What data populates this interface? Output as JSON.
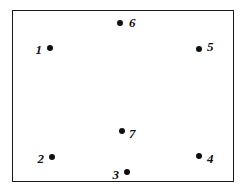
{
  "figure": {
    "background_color": "#ffffff",
    "border_color": "#1a1a1a",
    "marker_color": "#101010",
    "label_color": "#101010",
    "frame": {
      "x": 12,
      "y": 10,
      "width": 222,
      "height": 172
    }
  },
  "chart_data": {
    "type": "scatter",
    "title": "",
    "xlabel": "",
    "ylabel": "",
    "grid": false,
    "legend": "none",
    "axis_ticks": false,
    "xlim": [
      12,
      234
    ],
    "ylim": [
      10,
      182
    ],
    "marker_style": "filled-circle",
    "marker_size_px": 6,
    "label_style": "italic-serif-numeral",
    "points": [
      {
        "label": "1",
        "x": 50,
        "y": 48,
        "label_side": "left",
        "label_x": 42,
        "label_y": 49
      },
      {
        "label": "2",
        "x": 52,
        "y": 157,
        "label_side": "left",
        "label_x": 44,
        "label_y": 158
      },
      {
        "label": "3",
        "x": 127,
        "y": 172,
        "label_side": "left",
        "label_x": 119,
        "label_y": 174
      },
      {
        "label": "4",
        "x": 199,
        "y": 156,
        "label_side": "right",
        "label_x": 207,
        "label_y": 158
      },
      {
        "label": "5",
        "x": 199,
        "y": 49,
        "label_side": "right",
        "label_x": 207,
        "label_y": 46
      },
      {
        "label": "6",
        "x": 120,
        "y": 23,
        "label_side": "right",
        "label_x": 129,
        "label_y": 22
      },
      {
        "label": "7",
        "x": 122,
        "y": 131,
        "label_side": "right",
        "label_x": 129,
        "label_y": 133
      }
    ]
  }
}
